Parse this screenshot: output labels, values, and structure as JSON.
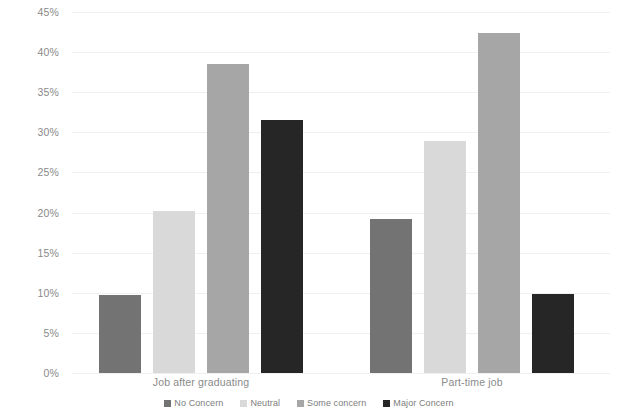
{
  "chart_data": {
    "type": "bar",
    "title": "",
    "xlabel": "",
    "ylabel": "",
    "categories": [
      "Job after graduating",
      "Part-time job"
    ],
    "series": [
      {
        "name": "No Concern",
        "color": "#737373",
        "values": [
          9.7,
          19.2
        ]
      },
      {
        "name": "Neutral",
        "color": "#d9d9d9",
        "values": [
          20.2,
          28.9
        ]
      },
      {
        "name": "Some concern",
        "color": "#a6a6a6",
        "values": [
          38.5,
          42.4
        ]
      },
      {
        "name": "Major Concern",
        "color": "#262626",
        "values": [
          31.5,
          9.8
        ]
      }
    ],
    "ylim": [
      0,
      45
    ],
    "ytick_values": [
      0,
      5,
      10,
      15,
      20,
      25,
      30,
      35,
      40,
      45
    ],
    "ytick_labels": [
      "0%",
      "5%",
      "10%",
      "15%",
      "20%",
      "25%",
      "30%",
      "35%",
      "40%",
      "45%"
    ],
    "grid": true,
    "legend_position": "bottom"
  },
  "axis": {
    "y_ticks": [
      "45%",
      "40%",
      "35%",
      "30%",
      "25%",
      "20%",
      "15%",
      "10%",
      "5%",
      "0%"
    ],
    "x_categories": [
      "Job after graduating",
      "Part-time job"
    ]
  },
  "legend": {
    "items": [
      {
        "label": "No Concern"
      },
      {
        "label": "Neutral"
      },
      {
        "label": "Some concern"
      },
      {
        "label": "Major Concern"
      }
    ]
  }
}
